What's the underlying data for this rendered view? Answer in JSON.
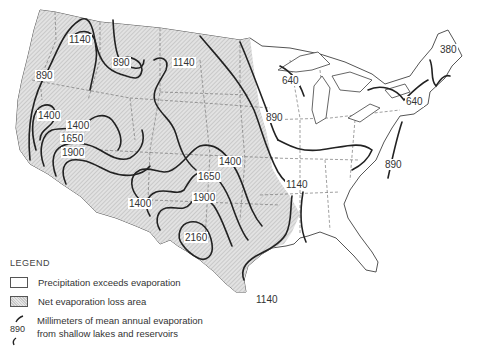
{
  "map": {
    "title": "Mean annual evaporation from shallow lakes and reservoirs, contiguous United States",
    "units": "mm",
    "colors": {
      "net_loss_fill": "#d8d8d8",
      "precip_fill": "#ffffff",
      "isoline": "#222222",
      "border": "#555555"
    },
    "isoline_labels": [
      {
        "id": "l1140_nw",
        "text": "1140",
        "x": 88,
        "y": 42
      },
      {
        "id": "l890_nw",
        "text": "890",
        "x": 123,
        "y": 61
      },
      {
        "id": "l1140_n",
        "text": "1140",
        "x": 183,
        "y": 64
      },
      {
        "id": "l890_w",
        "text": "890",
        "x": 45,
        "y": 76
      },
      {
        "id": "l1400_w1",
        "text": "1400",
        "x": 50,
        "y": 117
      },
      {
        "id": "l1400_w2",
        "text": "1400",
        "x": 79,
        "y": 126
      },
      {
        "id": "l1650_w",
        "text": "1650",
        "x": 76,
        "y": 139
      },
      {
        "id": "l1900_w",
        "text": "1900",
        "x": 74,
        "y": 153
      },
      {
        "id": "l640_n",
        "text": "640",
        "x": 291,
        "y": 82
      },
      {
        "id": "l380_ne",
        "text": "380",
        "x": 448,
        "y": 51
      },
      {
        "id": "l640_ne",
        "text": "640",
        "x": 414,
        "y": 103
      },
      {
        "id": "l890_c",
        "text": "890",
        "x": 275,
        "y": 118
      },
      {
        "id": "l890_e",
        "text": "890",
        "x": 393,
        "y": 166
      },
      {
        "id": "l1400_c",
        "text": "1400",
        "x": 225,
        "y": 162
      },
      {
        "id": "l1650_c",
        "text": "1650",
        "x": 197,
        "y": 177
      },
      {
        "id": "l1140_c",
        "text": "1140",
        "x": 297,
        "y": 185
      },
      {
        "id": "l1900_c",
        "text": "1900",
        "x": 189,
        "y": 198
      },
      {
        "id": "l1400_sw",
        "text": "1400",
        "x": 146,
        "y": 204
      },
      {
        "id": "l2160",
        "text": "2160",
        "x": 176,
        "y": 238
      },
      {
        "id": "l1140_s",
        "text": "1140",
        "x": 265,
        "y": 300
      }
    ]
  },
  "legend": {
    "title": "LEGEND",
    "items": [
      {
        "type": "white-box",
        "label": "Precipitation exceeds evaporation"
      },
      {
        "type": "hatched-box",
        "label": "Net evaporation loss area"
      },
      {
        "type": "isoline",
        "symbol_value": "890",
        "label_line1": "Millimeters of mean annual evaporation",
        "label_line2": "from shallow lakes and reservoirs"
      }
    ]
  }
}
